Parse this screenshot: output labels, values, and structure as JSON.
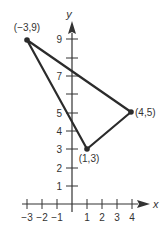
{
  "diagram": {
    "type": "coordinate-plane-triangle",
    "colors": {
      "axis": "#333333",
      "triangle": "#2b2b2b",
      "text": "#333333",
      "background": "#ffffff"
    },
    "axes": {
      "x_label": "x",
      "y_label": "y",
      "x_ticks": [
        -3,
        -2,
        -1,
        1,
        2,
        3,
        4
      ],
      "x_tick_labels": [
        "−3",
        "−2",
        "−1",
        "1",
        "2",
        "3",
        "4"
      ],
      "y_ticks": [
        1,
        2,
        3,
        4,
        5,
        6,
        7,
        8,
        9
      ],
      "y_tick_labels": [
        "1",
        "2",
        "3",
        "4",
        "5",
        "",
        "7",
        "",
        "9"
      ]
    },
    "points": [
      {
        "x": -3,
        "y": 9,
        "label": "(−3,9)"
      },
      {
        "x": 4,
        "y": 5,
        "label": "(4,5)"
      },
      {
        "x": 1,
        "y": 3,
        "label": "(1,3)"
      }
    ]
  }
}
